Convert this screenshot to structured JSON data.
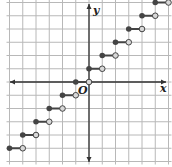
{
  "chart_data": {
    "type": "line",
    "subtype": "step-function",
    "title": "",
    "xlabel": "x",
    "ylabel": "y",
    "origin_label": "O",
    "xlim": [
      -6,
      6
    ],
    "ylim": [
      -6,
      6
    ],
    "grid": true,
    "tick_labels": false,
    "segments": [
      {
        "x_start": -6,
        "x_end": -5,
        "y": -5,
        "start": "closed",
        "end": "open"
      },
      {
        "x_start": -5,
        "x_end": -4,
        "y": -4,
        "start": "closed",
        "end": "open"
      },
      {
        "x_start": -4,
        "x_end": -3,
        "y": -3,
        "start": "closed",
        "end": "open"
      },
      {
        "x_start": -3,
        "x_end": -2,
        "y": -2,
        "start": "closed",
        "end": "open"
      },
      {
        "x_start": -2,
        "x_end": -1,
        "y": -1,
        "start": "closed",
        "end": "open"
      },
      {
        "x_start": -1,
        "x_end": 0,
        "y": 0,
        "start": "closed",
        "end": "open"
      },
      {
        "x_start": 0,
        "x_end": 1,
        "y": 1,
        "start": "closed",
        "end": "open"
      },
      {
        "x_start": 1,
        "x_end": 2,
        "y": 2,
        "start": "closed",
        "end": "open"
      },
      {
        "x_start": 2,
        "x_end": 3,
        "y": 3,
        "start": "closed",
        "end": "open"
      },
      {
        "x_start": 3,
        "x_end": 4,
        "y": 4,
        "start": "closed",
        "end": "open"
      },
      {
        "x_start": 4,
        "x_end": 5,
        "y": 5,
        "start": "closed",
        "end": "open"
      },
      {
        "x_start": 5,
        "x_end": 6,
        "y": 6,
        "start": "closed",
        "end": "open"
      }
    ],
    "colors": {
      "grid": "#b8b8b8",
      "axis": "#333333",
      "segment": "#444444",
      "closed_dot": "#444444",
      "open_dot_fill": "#d8d8d8"
    }
  }
}
